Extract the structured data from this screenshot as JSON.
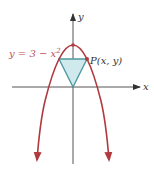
{
  "diagram": {
    "title": "",
    "equation_label": "y = 3 − x",
    "equation_exponent": "2",
    "point_label": "P(x, y)",
    "x_axis_label": "x",
    "y_axis_label": "y",
    "colors": {
      "curve": "#b03a3e",
      "equation_text": "#c0505a",
      "axis": "#555555",
      "triangle_fill": "#cfe9ec",
      "triangle_stroke": "#4e9aa0",
      "point_text": "#333333"
    },
    "curve": {
      "function": "y = 3 - x^2",
      "vertex": [
        0,
        3
      ],
      "x_intercepts": [
        -1.732,
        1.732
      ]
    },
    "point_P": {
      "x": 1,
      "y": 2
    },
    "triangle_vertices": [
      [
        -1,
        2
      ],
      [
        1,
        2
      ],
      [
        0,
        0
      ]
    ]
  }
}
